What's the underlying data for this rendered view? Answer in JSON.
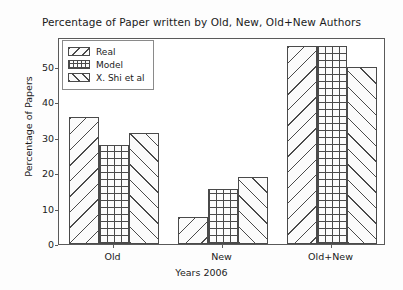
{
  "chart_data": {
    "type": "bar",
    "title": "Percentage of Paper written by Old, New, Old+New Authors",
    "xlabel": "Years 2006",
    "ylabel": "Percentage of Papers",
    "categories": [
      "Old",
      "New",
      "Old+New"
    ],
    "series": [
      {
        "name": "Real",
        "hatch": "\\",
        "values": [
          36.0,
          7.5,
          56.0
        ]
      },
      {
        "name": "Model",
        "hatch": "+",
        "values": [
          28.0,
          15.5,
          56.0
        ]
      },
      {
        "name": "X. Shi et al",
        "hatch": "/",
        "values": [
          31.5,
          19.0,
          50.0
        ]
      }
    ],
    "ylim": [
      0,
      58.5
    ],
    "yticks": [
      0,
      10,
      20,
      30,
      40,
      50
    ],
    "ytick_labels": [
      "0",
      "10",
      "20",
      "30",
      "40",
      "50"
    ],
    "grid": false,
    "legend_position": "upper left",
    "colors": {
      "edge": "#4a4a4a",
      "face": "#fbfbfb",
      "text": "#1b1b1b",
      "frame": "#5a5a5a",
      "background": "#ffffff"
    }
  },
  "legend": {
    "items": [
      {
        "label": "Real"
      },
      {
        "label": "Model"
      },
      {
        "label": "X. Shi et al"
      }
    ]
  }
}
